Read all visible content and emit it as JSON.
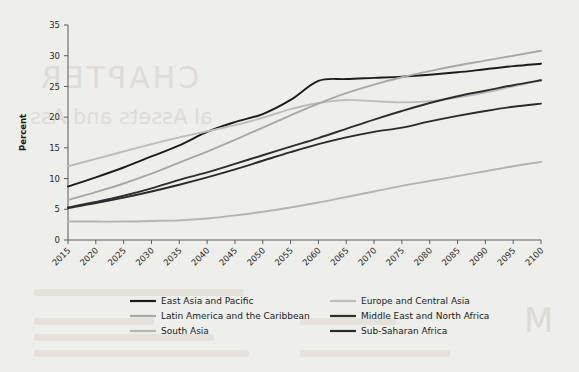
{
  "figure": {
    "background_color": "#eeeeea",
    "ylabel": "Percent"
  },
  "ghost_text": {
    "chapter": "CHAPTER",
    "subtitle": "al Assets and Ass",
    "marginal": "M"
  },
  "chart_data": {
    "type": "line",
    "title": "",
    "xlabel": "",
    "ylabel": "Percent",
    "xlim": [
      2015,
      2100
    ],
    "ylim": [
      0,
      35
    ],
    "yticks": [
      0,
      5,
      10,
      15,
      20,
      25,
      30,
      35
    ],
    "grid": false,
    "legend_position": "below",
    "x": [
      2015,
      2020,
      2025,
      2030,
      2035,
      2040,
      2045,
      2050,
      2055,
      2060,
      2065,
      2070,
      2075,
      2080,
      2085,
      2090,
      2095,
      2100
    ],
    "categories": [
      "2015",
      "2020",
      "2025",
      "2030",
      "2035",
      "2040",
      "2045",
      "2050",
      "2055",
      "2060",
      "2065",
      "2070",
      "2075",
      "2080",
      "2085",
      "2090",
      "2095",
      "2100"
    ],
    "series": [
      {
        "name": "East Asia and Pacific",
        "color": "#1c1c1c",
        "width": 1.9,
        "values": [
          8.7,
          10.2,
          11.8,
          13.6,
          15.4,
          17.6,
          19.2,
          20.5,
          22.8,
          25.9,
          26.2,
          26.4,
          26.6,
          26.9,
          27.3,
          27.8,
          28.3,
          28.7
        ]
      },
      {
        "name": "Europe and Central Asia",
        "color": "#bcbcbc",
        "width": 1.9,
        "values": [
          12.0,
          13.2,
          14.4,
          15.6,
          16.7,
          17.7,
          18.7,
          19.9,
          21.3,
          22.3,
          22.8,
          22.6,
          22.4,
          22.6,
          23.2,
          24.0,
          25.0,
          26.0
        ]
      },
      {
        "name": "Latin America and the Caribbean",
        "color": "#a8a8a8",
        "width": 1.9,
        "values": [
          6.5,
          7.8,
          9.2,
          10.8,
          12.6,
          14.4,
          16.3,
          18.3,
          20.3,
          22.2,
          23.9,
          25.3,
          26.5,
          27.5,
          28.4,
          29.2,
          30.0,
          30.8
        ]
      },
      {
        "name": "Middle East and North Africa",
        "color": "#2e2e2e",
        "width": 1.9,
        "values": [
          5.3,
          6.2,
          7.2,
          8.4,
          9.8,
          11.0,
          12.4,
          13.8,
          15.2,
          16.6,
          18.1,
          19.6,
          21.0,
          22.3,
          23.4,
          24.3,
          25.2,
          26.0
        ]
      },
      {
        "name": "South Asia",
        "color": "#b4b4b4",
        "width": 1.9,
        "values": [
          3.0,
          3.0,
          3.0,
          3.1,
          3.2,
          3.5,
          4.0,
          4.6,
          5.3,
          6.1,
          7.0,
          7.9,
          8.8,
          9.6,
          10.4,
          11.2,
          12.0,
          12.7
        ]
      },
      {
        "name": "Sub-Saharan Africa",
        "color": "#2b2b2b",
        "width": 1.9,
        "values": [
          5.2,
          6.0,
          6.9,
          7.9,
          9.0,
          10.2,
          11.5,
          12.9,
          14.3,
          15.6,
          16.7,
          17.6,
          18.3,
          19.3,
          20.2,
          21.0,
          21.7,
          22.2
        ]
      }
    ],
    "legend": [
      {
        "label": "East Asia and Pacific",
        "color": "#1c1c1c",
        "col": 0,
        "row": 0
      },
      {
        "label": "Europe and Central Asia",
        "color": "#bcbcbc",
        "col": 1,
        "row": 0
      },
      {
        "label": "Latin America and the Caribbean",
        "color": "#a8a8a8",
        "col": 0,
        "row": 1
      },
      {
        "label": "Middle East and North Africa",
        "color": "#2e2e2e",
        "col": 1,
        "row": 1
      },
      {
        "label": "South Asia",
        "color": "#b4b4b4",
        "col": 0,
        "row": 2
      },
      {
        "label": "Sub-Saharan Africa",
        "color": "#2b2b2b",
        "col": 1,
        "row": 2
      }
    ]
  }
}
